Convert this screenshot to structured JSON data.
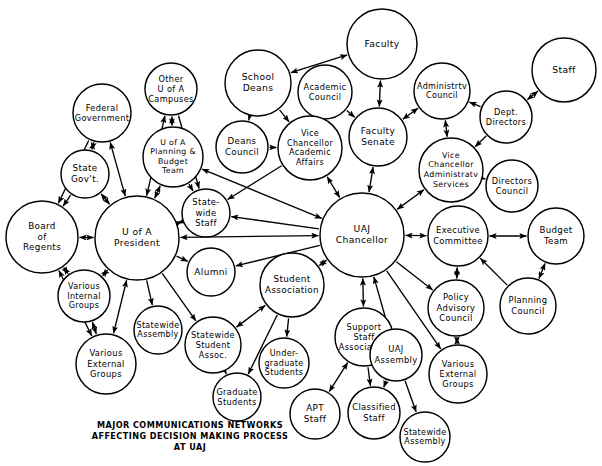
{
  "diagram": {
    "caption_lines": [
      "MAJOR COMMUNICATIONS NETWORKS",
      "AFFECTING DECISION MAKING PROCESS",
      "AT UAJ"
    ],
    "caption_x": 190,
    "caption_y": 428,
    "caption_line_height": 11,
    "stroke_color": "#000000",
    "fill_color": "#ffffff",
    "background_color": "#ffffff"
  },
  "chart_data": {
    "type": "diagram",
    "subtype": "node-link-network",
    "node_count": 40,
    "edge_count": 57,
    "nodes": [
      {
        "id": "faculty",
        "label": "Faculty",
        "lines": [
          "Faculty"
        ],
        "cx": 382,
        "cy": 44,
        "r": 35,
        "fs": 9.2
      },
      {
        "id": "staff",
        "label": "Staff",
        "lines": [
          "Staff"
        ],
        "cx": 564,
        "cy": 70,
        "r": 32,
        "fs": 9.2
      },
      {
        "id": "school_deans",
        "label": "School Deans",
        "lines": [
          "School",
          "Deans"
        ],
        "cx": 258,
        "cy": 83,
        "r": 33,
        "fs": 9.2
      },
      {
        "id": "other_uofa",
        "label": "Other U of A Campuses",
        "lines": [
          "Other",
          "U of A",
          "Campuses"
        ],
        "cx": 171,
        "cy": 89,
        "r": 26,
        "fs": 8.2
      },
      {
        "id": "academic_council",
        "label": "Academic Council",
        "lines": [
          "Academic",
          "Council"
        ],
        "cx": 325,
        "cy": 92,
        "r": 27,
        "fs": 8.2
      },
      {
        "id": "administrtv_council",
        "label": "Administrtv Council",
        "lines": [
          "Administrtv",
          "Council"
        ],
        "cx": 442,
        "cy": 91,
        "r": 28,
        "fs": 8.0
      },
      {
        "id": "federal_gov",
        "label": "Federal Government",
        "lines": [
          "Federal",
          "Government"
        ],
        "cx": 102,
        "cy": 113,
        "r": 29,
        "fs": 8.2
      },
      {
        "id": "dept_directors",
        "label": "Dept. Directors",
        "lines": [
          "Dept.",
          "Directors"
        ],
        "cx": 506,
        "cy": 117,
        "r": 26,
        "fs": 8.2
      },
      {
        "id": "faculty_senate",
        "label": "Faculty Senate",
        "lines": [
          "Faculty",
          "Senate"
        ],
        "cx": 378,
        "cy": 137,
        "r": 29,
        "fs": 9.0
      },
      {
        "id": "deans_council",
        "label": "Deans Council",
        "lines": [
          "Deans",
          "Council"
        ],
        "cx": 242,
        "cy": 147,
        "r": 26,
        "fs": 8.6
      },
      {
        "id": "vc_academic",
        "label": "Vice Chancellor Academic Affairs",
        "lines": [
          "Vice",
          "Chancellor",
          "Academic",
          "Affairs"
        ],
        "cx": 310,
        "cy": 148,
        "r": 32,
        "fs": 8.0
      },
      {
        "id": "planning_budget",
        "label": "U of A Planning & Budget Team",
        "lines": [
          "U of A",
          "Planning &",
          "Budget",
          "Team"
        ],
        "cx": 173,
        "cy": 157,
        "r": 30,
        "fs": 7.8
      },
      {
        "id": "vc_admin",
        "label": "Vice Chancellor Administratv Services",
        "lines": [
          "Vice",
          "Chancellor",
          "Administratv",
          "Services"
        ],
        "cx": 451,
        "cy": 170,
        "r": 32,
        "fs": 7.9
      },
      {
        "id": "state_gov",
        "label": "State Gov't.",
        "lines": [
          "State",
          "Gov't."
        ],
        "cx": 85,
        "cy": 174,
        "r": 24,
        "fs": 8.8
      },
      {
        "id": "directors_council",
        "label": "Directors Council",
        "lines": [
          "Directors",
          "Council"
        ],
        "cx": 512,
        "cy": 186,
        "r": 26,
        "fs": 8.2
      },
      {
        "id": "statewide_staff",
        "label": "State-wide Staff",
        "lines": [
          "State-",
          "wide",
          "Staff"
        ],
        "cx": 206,
        "cy": 213,
        "r": 24,
        "fs": 8.4
      },
      {
        "id": "uofa_president",
        "label": "U of A President",
        "lines": [
          "U of A",
          "President"
        ],
        "cx": 137,
        "cy": 238,
        "r": 42,
        "fs": 9.2
      },
      {
        "id": "uaj_chancellor",
        "label": "UAJ Chancellor",
        "lines": [
          "UAJ",
          "Chancellor"
        ],
        "cx": 362,
        "cy": 235,
        "r": 42,
        "fs": 9.2
      },
      {
        "id": "board_regents",
        "label": "Board of Regents",
        "lines": [
          "Board",
          "of",
          "Regents"
        ],
        "cx": 42,
        "cy": 237,
        "r": 36,
        "fs": 8.8
      },
      {
        "id": "exec_committee",
        "label": "Executive Committee",
        "lines": [
          "Executive",
          "Committee"
        ],
        "cx": 458,
        "cy": 236,
        "r": 30,
        "fs": 8.4
      },
      {
        "id": "budget_team",
        "label": "Budget Team",
        "lines": [
          "Budget",
          "Team"
        ],
        "cx": 556,
        "cy": 236,
        "r": 28,
        "fs": 8.6
      },
      {
        "id": "alumni",
        "label": "Alumni",
        "lines": [
          "Alumni"
        ],
        "cx": 211,
        "cy": 272,
        "r": 24,
        "fs": 9.0
      },
      {
        "id": "student_assoc",
        "label": "Student Association",
        "lines": [
          "Student",
          "Association"
        ],
        "cx": 292,
        "cy": 285,
        "r": 32,
        "fs": 8.8
      },
      {
        "id": "various_internal",
        "label": "Various Internal Groups",
        "lines": [
          "Various",
          "Internal",
          "Groups"
        ],
        "cx": 84,
        "cy": 296,
        "r": 26,
        "fs": 8.0
      },
      {
        "id": "policy_advisory",
        "label": "Policy Advisory Council",
        "lines": [
          "Policy",
          "Advisory",
          "Council"
        ],
        "cx": 456,
        "cy": 308,
        "r": 28,
        "fs": 8.4
      },
      {
        "id": "planning_council",
        "label": "Planning Council",
        "lines": [
          "Planning",
          "Council"
        ],
        "cx": 528,
        "cy": 306,
        "r": 28,
        "fs": 8.4
      },
      {
        "id": "statewide_assembly_l",
        "label": "Statewide Assembly",
        "lines": [
          "Statewide",
          "Assembly"
        ],
        "cx": 158,
        "cy": 330,
        "r": 24,
        "fs": 8.0
      },
      {
        "id": "support_staff",
        "label": "Support Staff Association",
        "lines": [
          "Support",
          "Staff",
          "Association"
        ],
        "cx": 364,
        "cy": 337,
        "r": 29,
        "fs": 8.2
      },
      {
        "id": "uaj_assembly",
        "label": "UAJ Assembly",
        "lines": [
          "UAJ",
          "Assembly"
        ],
        "cx": 396,
        "cy": 355,
        "r": 26,
        "fs": 8.4
      },
      {
        "id": "statewide_student",
        "label": "Statewide Student Assoc.",
        "lines": [
          "Statewide",
          "Student",
          "Assoc."
        ],
        "cx": 213,
        "cy": 345,
        "r": 28,
        "fs": 8.2
      },
      {
        "id": "various_external_l",
        "label": "Various External Groups",
        "lines": [
          "Various",
          "External",
          "Groups"
        ],
        "cx": 106,
        "cy": 364,
        "r": 30,
        "fs": 8.4
      },
      {
        "id": "undergrad",
        "label": "Under-graduate Students",
        "lines": [
          "Under-",
          "graduate",
          "Students"
        ],
        "cx": 284,
        "cy": 363,
        "r": 25,
        "fs": 8.0
      },
      {
        "id": "various_external_r",
        "label": "Various External Groups",
        "lines": [
          "Various",
          "External",
          "Groups"
        ],
        "cx": 458,
        "cy": 374,
        "r": 29,
        "fs": 8.2
      },
      {
        "id": "graduate",
        "label": "Graduate Students",
        "lines": [
          "Graduate",
          "Students"
        ],
        "cx": 237,
        "cy": 397,
        "r": 24,
        "fs": 8.2
      },
      {
        "id": "apt_staff",
        "label": "APT Staff",
        "lines": [
          "APT",
          "Staff"
        ],
        "cx": 315,
        "cy": 414,
        "r": 25,
        "fs": 8.8
      },
      {
        "id": "classified_staff",
        "label": "Classified Staff",
        "lines": [
          "Classified",
          "Staff"
        ],
        "cx": 374,
        "cy": 413,
        "r": 26,
        "fs": 8.4
      },
      {
        "id": "statewide_assembly_r",
        "label": "Statewide Assembly",
        "lines": [
          "Statewide",
          "Assembly"
        ],
        "cx": 425,
        "cy": 437,
        "r": 25,
        "fs": 8.0
      }
    ],
    "edges": [
      {
        "from": "federal_gov",
        "to": "state_gov",
        "dir": "both"
      },
      {
        "from": "federal_gov",
        "to": "board_regents",
        "dir": "to"
      },
      {
        "from": "federal_gov",
        "to": "uofa_president",
        "dir": "both"
      },
      {
        "from": "state_gov",
        "to": "board_regents",
        "dir": "to"
      },
      {
        "from": "state_gov",
        "to": "uofa_president",
        "dir": "both"
      },
      {
        "from": "other_uofa",
        "to": "planning_budget",
        "dir": "both"
      },
      {
        "from": "other_uofa",
        "to": "uofa_president",
        "dir": "both"
      },
      {
        "from": "other_uofa",
        "to": "statewide_staff",
        "dir": "to"
      },
      {
        "from": "planning_budget",
        "to": "uofa_president",
        "dir": "both"
      },
      {
        "from": "planning_budget",
        "to": "statewide_staff",
        "dir": "to"
      },
      {
        "from": "planning_budget",
        "to": "uaj_chancellor",
        "dir": "both"
      },
      {
        "from": "board_regents",
        "to": "uofa_president",
        "dir": "both"
      },
      {
        "from": "board_regents",
        "to": "various_internal",
        "dir": "both"
      },
      {
        "from": "board_regents",
        "to": "various_external_l",
        "dir": "both"
      },
      {
        "from": "uofa_president",
        "to": "various_internal",
        "dir": "both"
      },
      {
        "from": "uofa_president",
        "to": "various_external_l",
        "dir": "both"
      },
      {
        "from": "uofa_president",
        "to": "statewide_assembly_l",
        "dir": "to"
      },
      {
        "from": "uofa_president",
        "to": "statewide_student",
        "dir": "to"
      },
      {
        "from": "uofa_president",
        "to": "alumni",
        "dir": "to"
      },
      {
        "from": "uofa_president",
        "to": "statewide_staff",
        "dir": "both"
      },
      {
        "from": "uofa_president",
        "to": "uaj_chancellor",
        "dir": "both"
      },
      {
        "from": "various_internal",
        "to": "various_external_l",
        "dir": "both"
      },
      {
        "from": "statewide_student",
        "to": "graduate",
        "dir": "to"
      },
      {
        "from": "statewide_student",
        "to": "student_assoc",
        "dir": "both"
      },
      {
        "from": "school_deans",
        "to": "faculty",
        "dir": "both"
      },
      {
        "from": "school_deans",
        "to": "vc_academic",
        "dir": "to"
      },
      {
        "from": "school_deans",
        "to": "deans_council",
        "dir": "to"
      },
      {
        "from": "academic_council",
        "to": "vc_academic",
        "dir": "to"
      },
      {
        "from": "academic_council",
        "to": "faculty_senate",
        "dir": "to"
      },
      {
        "from": "faculty",
        "to": "faculty_senate",
        "dir": "both"
      },
      {
        "from": "faculty_senate",
        "to": "administrtv_council",
        "dir": "both"
      },
      {
        "from": "faculty_senate",
        "to": "uaj_chancellor",
        "dir": "both"
      },
      {
        "from": "deans_council",
        "to": "vc_academic",
        "dir": "to"
      },
      {
        "from": "vc_academic",
        "to": "uaj_chancellor",
        "dir": "both"
      },
      {
        "from": "vc_academic",
        "to": "statewide_staff",
        "dir": "to"
      },
      {
        "from": "administrtv_council",
        "to": "vc_admin",
        "dir": "both"
      },
      {
        "from": "staff",
        "to": "dept_directors",
        "dir": "both"
      },
      {
        "from": "dept_directors",
        "to": "administrtv_council",
        "dir": "to"
      },
      {
        "from": "dept_directors",
        "to": "vc_admin",
        "dir": "to"
      },
      {
        "from": "vc_admin",
        "to": "directors_council",
        "dir": "to"
      },
      {
        "from": "vc_admin",
        "to": "uaj_chancellor",
        "dir": "both"
      },
      {
        "from": "uaj_chancellor",
        "to": "exec_committee",
        "dir": "both"
      },
      {
        "from": "uaj_chancellor",
        "to": "statewide_staff",
        "dir": "to"
      },
      {
        "from": "uaj_chancellor",
        "to": "alumni",
        "dir": "to"
      },
      {
        "from": "uaj_chancellor",
        "to": "student_assoc",
        "dir": "both"
      },
      {
        "from": "uaj_chancellor",
        "to": "support_staff",
        "dir": "both"
      },
      {
        "from": "uaj_chancellor",
        "to": "uaj_assembly",
        "dir": "both"
      },
      {
        "from": "uaj_chancellor",
        "to": "policy_advisory",
        "dir": "to"
      },
      {
        "from": "uaj_chancellor",
        "to": "various_external_r",
        "dir": "to"
      },
      {
        "from": "exec_committee",
        "to": "budget_team",
        "dir": "both"
      },
      {
        "from": "exec_committee",
        "to": "policy_advisory",
        "dir": "both"
      },
      {
        "from": "budget_team",
        "to": "planning_council",
        "dir": "both"
      },
      {
        "from": "planning_council",
        "to": "exec_committee",
        "dir": "to"
      },
      {
        "from": "policy_advisory",
        "to": "various_external_r",
        "dir": "both"
      },
      {
        "from": "student_assoc",
        "to": "undergrad",
        "dir": "to"
      },
      {
        "from": "student_assoc",
        "to": "graduate",
        "dir": "to"
      },
      {
        "from": "support_staff",
        "to": "apt_staff",
        "dir": "both"
      },
      {
        "from": "support_staff",
        "to": "classified_staff",
        "dir": "to"
      },
      {
        "from": "uaj_assembly",
        "to": "classified_staff",
        "dir": "to"
      },
      {
        "from": "uaj_assembly",
        "to": "statewide_assembly_r",
        "dir": "to"
      }
    ]
  }
}
